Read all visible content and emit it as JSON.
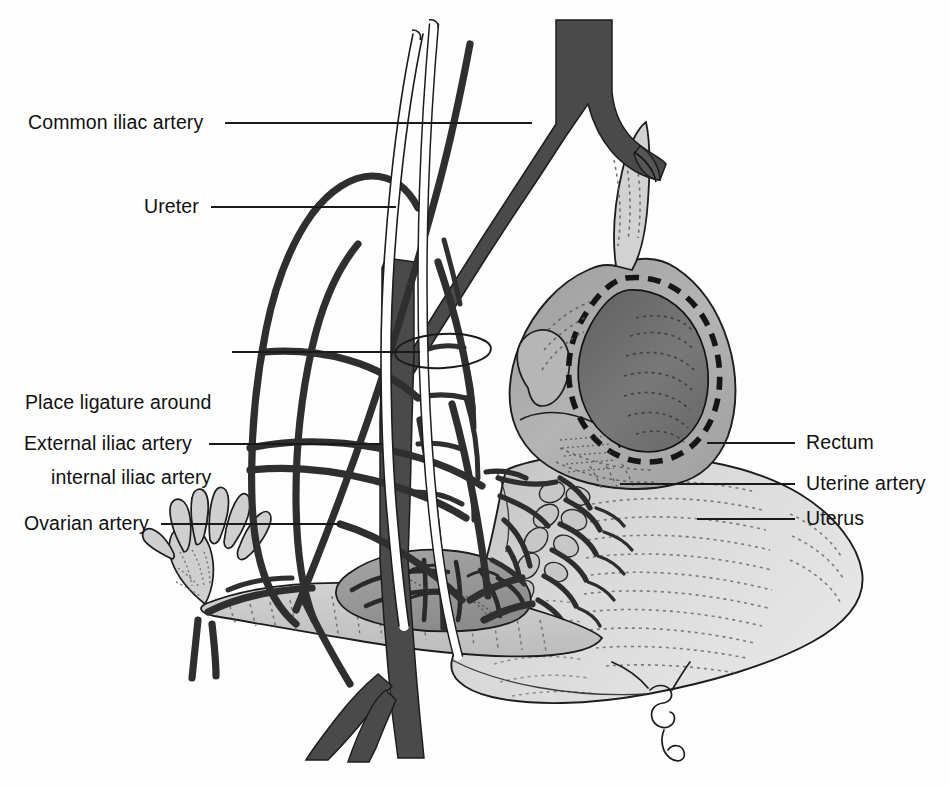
{
  "figure": {
    "type": "medical-anatomical-illustration",
    "background_color": "#fefefe",
    "palette": {
      "artery_dark": "#4a4a4a",
      "vessel_outline": "#3a3a3a",
      "uterus_light": "#d6d6d6",
      "rectum_mid": "#a8a8a8",
      "rectum_lumen": "#6e6e6e",
      "ovary_gray": "#9a9a9a",
      "tube_gray": "#c9c9c9",
      "leader_line": "#1a1a1a",
      "text": "#101010"
    }
  },
  "labels_left": [
    {
      "id": "common-iliac-artery",
      "text": "Common iliac artery",
      "lines": [
        "Common iliac artery"
      ],
      "text_x": 28,
      "text_y": 110,
      "leader_from_x": 225,
      "leader_from_y": 123,
      "leader_to_x": 532,
      "leader_to_y": 123
    },
    {
      "id": "ureter",
      "text": "Ureter",
      "lines": [
        "Ureter"
      ],
      "text_x": 144,
      "text_y": 194,
      "leader_from_x": 211,
      "leader_from_y": 207,
      "leader_to_x": 396,
      "leader_to_y": 207
    },
    {
      "id": "place-ligature-around-internal-iliac-artery",
      "text": "Place ligature around internal iliac artery",
      "lines": [
        "Place ligature around",
        "internal iliac artery"
      ],
      "text_x": 25,
      "text_y": 340,
      "leader_from_x": 232,
      "leader_from_y": 352,
      "leader_to_x": 420,
      "leader_to_y": 352
    },
    {
      "id": "external-iliac-artery",
      "text": "External iliac artery",
      "lines": [
        "External iliac artery"
      ],
      "text_x": 24,
      "text_y": 431,
      "leader_from_x": 209,
      "leader_from_y": 444,
      "leader_to_x": 383,
      "leader_to_y": 444
    },
    {
      "id": "ovarian-artery",
      "text": "Ovarian artery",
      "lines": [
        "Ovarian artery"
      ],
      "text_x": 24,
      "text_y": 511,
      "leader_from_x": 161,
      "leader_from_y": 524,
      "leader_to_x": 340,
      "leader_to_y": 524
    }
  ],
  "labels_right": [
    {
      "id": "rectum",
      "text": "Rectum",
      "lines": [
        "Rectum"
      ],
      "text_x": 806,
      "text_y": 430,
      "leader_from_x": 707,
      "leader_from_y": 443,
      "leader_to_x": 795,
      "leader_to_y": 443
    },
    {
      "id": "uterine-artery",
      "text": "Uterine artery",
      "lines": [
        "Uterine artery"
      ],
      "text_x": 806,
      "text_y": 471,
      "leader_from_x": 620,
      "leader_from_y": 484,
      "leader_to_x": 795,
      "leader_to_y": 484
    },
    {
      "id": "uterus",
      "text": "Uterus",
      "lines": [
        "Uterus"
      ],
      "text_x": 806,
      "text_y": 506,
      "leader_from_x": 697,
      "leader_from_y": 519,
      "leader_to_x": 795,
      "leader_to_y": 519
    }
  ],
  "structures": [
    {
      "id": "aorta-bifurcation",
      "name": "Aorta with common iliac bifurcation",
      "fill": "#4a4a4a"
    },
    {
      "id": "ureter-tube",
      "name": "Ureter",
      "fill": "#ffffff"
    },
    {
      "id": "internal-iliac-artery",
      "name": "Internal iliac artery",
      "fill": "#4a4a4a"
    },
    {
      "id": "external-iliac-artery-vessel",
      "name": "External iliac artery",
      "fill": "#4a4a4a"
    },
    {
      "id": "ligature-loop",
      "name": "Ligature loop around internal iliac artery",
      "fill": "none"
    },
    {
      "id": "ovarian-artery-vessel",
      "name": "Ovarian artery",
      "fill": "#3a3a3a"
    },
    {
      "id": "rectum-body",
      "name": "Rectum, cut in cross-section",
      "fill": "#a8a8a8"
    },
    {
      "id": "uterus-body",
      "name": "Uterus",
      "fill": "#d6d6d6"
    },
    {
      "id": "uterine-artery-plexus",
      "name": "Uterine artery plexus",
      "fill": "#3a3a3a"
    },
    {
      "id": "ovary",
      "name": "Ovary",
      "fill": "#9a9a9a"
    },
    {
      "id": "fallopian-tube",
      "name": "Fallopian tube with fimbriae",
      "fill": "#c9c9c9"
    },
    {
      "id": "iud-string",
      "name": "Cervical string",
      "fill": "none"
    }
  ]
}
